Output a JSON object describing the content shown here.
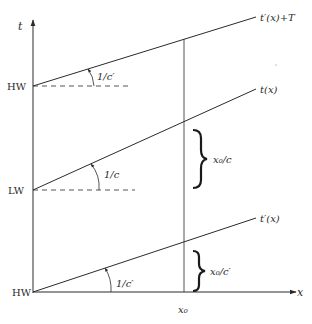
{
  "diagram": {
    "axes": {
      "y_label": "t",
      "x_label": "x"
    },
    "y_ticks": [
      {
        "label": "HW",
        "position": "top"
      },
      {
        "label": "LW",
        "position": "middle"
      },
      {
        "label": "HW",
        "position": "bottom"
      }
    ],
    "lines": [
      {
        "label": "t′(x)+T",
        "start_level": "HW (top)"
      },
      {
        "label": "t(x)",
        "start_level": "LW"
      },
      {
        "label": "t′(x)",
        "start_level": "HW (bottom)"
      }
    ],
    "slope_labels": [
      {
        "text": "1/c′",
        "line": "t′(x)+T"
      },
      {
        "text": "1/c",
        "line": "t(x)"
      },
      {
        "text": "1/c′",
        "line": "t′(x)"
      }
    ],
    "brace_labels": [
      {
        "text": "x₀/c",
        "between": "LW-line and t(x) at x₀"
      },
      {
        "text": "x₀/c′",
        "between": "x-axis and t′(x) at x₀"
      }
    ],
    "x_marker": "x₀",
    "colors": {
      "line": "#2a2a2a",
      "text": "#2a2a2a",
      "background": "#ffffff"
    }
  }
}
